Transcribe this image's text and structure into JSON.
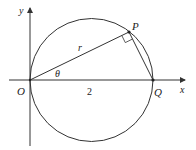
{
  "diagram": {
    "labels": {
      "y_axis": "y",
      "x_axis": "x",
      "origin": "O",
      "point_p": "P",
      "point_q": "Q",
      "radius": "r",
      "angle": "θ",
      "diameter_length": "2"
    },
    "colors": {
      "stroke": "#333333",
      "text": "#222222"
    }
  }
}
